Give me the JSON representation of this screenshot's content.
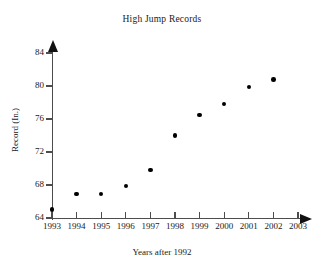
{
  "chart_data": {
    "type": "scatter",
    "title": "High Jump Records",
    "xlabel": "Years after 1992",
    "ylabel": "Record (In.)",
    "x": [
      1993,
      1994,
      1995,
      1996,
      1997,
      1998,
      1999,
      2000,
      2001,
      2002
    ],
    "values": [
      65.0,
      66.9,
      66.9,
      67.9,
      69.8,
      74.0,
      76.5,
      77.8,
      79.9,
      80.8
    ],
    "xticks": [
      "1993",
      "1994",
      "1995",
      "1996",
      "1997",
      "1998",
      "1999",
      "2000",
      "2001",
      "2002",
      "2003"
    ],
    "yticks": [
      "64",
      "68",
      "72",
      "76",
      "80",
      "84"
    ],
    "xlim": [
      1993,
      2003
    ],
    "ylim": [
      64,
      84
    ],
    "grid": false,
    "legend": null,
    "marker": "filled-circle",
    "marker_color": "#000000",
    "axis_color": "#4d4d4d",
    "text_color": "#1a1a1a",
    "background": "#ffffff"
  }
}
